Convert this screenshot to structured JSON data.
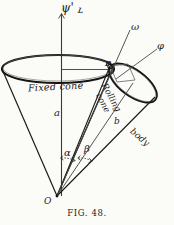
{
  "figure": {
    "caption": "FIG. 48.",
    "apex_label": "O",
    "contact_point_label": "P",
    "axis_label": "ψ'",
    "axis_label_secondary": "ʟ",
    "omega_label": "ω",
    "phi_label": "φ",
    "fixed_cone_label": "Fixed cone",
    "rolling_cone_label_line1": "Rolling",
    "rolling_cone_label_line2": "cone",
    "body_label": "body",
    "side_a_label": "a",
    "side_b_label": "b",
    "angle_alpha_label": "α",
    "angle_beta_label": "β"
  },
  "colors": {
    "ink": "#1b1b1b",
    "paper": "#fbfbf8",
    "thin_line": "#3a3a3a"
  }
}
